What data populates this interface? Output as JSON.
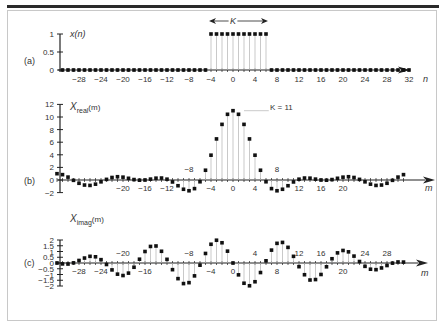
{
  "chart_data": [
    {
      "type": "scatter",
      "panel_label": "(a)",
      "title": "x(n)",
      "xlabel": "n",
      "ylabel": "x(n)",
      "annotation": "K",
      "xlim": [
        -32,
        33
      ],
      "ylim": [
        0,
        1
      ],
      "x_ticks": [
        -28,
        -24,
        -20,
        -16,
        -12,
        -8,
        -4,
        0,
        4,
        8,
        12,
        16,
        20,
        24,
        28,
        32
      ],
      "y_ticks": [
        0,
        0.5,
        1
      ],
      "y_tick_labels": [
        "0",
        "0.5",
        "1"
      ],
      "pulse_start": -4,
      "pulse_end": 6,
      "n_start": -32,
      "n_end": 32
    },
    {
      "type": "scatter",
      "panel_label": "(b)",
      "title": "X_real(m)",
      "xlabel": "m",
      "ylabel": "X_real(m)",
      "annotation": "K = 11",
      "ylim": [
        -2,
        12
      ],
      "y_ticks": [
        -2,
        0,
        2,
        4,
        6,
        8,
        10,
        12
      ],
      "x_tick_labels_below": [
        -20,
        -16,
        -12,
        -4,
        0,
        4,
        12,
        16,
        20
      ],
      "x_tick_labels_above": [
        -8,
        8
      ],
      "m": [
        -32,
        -31,
        -30,
        -29,
        -28,
        -27,
        -26,
        -25,
        -24,
        -23,
        -22,
        -21,
        -20,
        -19,
        -18,
        -17,
        -16,
        -15,
        -14,
        -13,
        -12,
        -11,
        -10,
        -9,
        -8,
        -7,
        -6,
        -5,
        -4,
        -3,
        -2,
        -1,
        0,
        1,
        2,
        3,
        4,
        5,
        6,
        7,
        8,
        9,
        10,
        11,
        12,
        13,
        14,
        15,
        16,
        17,
        18,
        19,
        20,
        21,
        22,
        23,
        24,
        25,
        26,
        27,
        28,
        29,
        30,
        31
      ],
      "values": [
        1.0,
        0.85,
        0.46,
        -0.05,
        -0.52,
        -0.8,
        -0.86,
        -0.66,
        -0.29,
        0.1,
        0.4,
        0.52,
        0.45,
        0.27,
        0.07,
        -0.03,
        0,
        0.14,
        0.29,
        0.31,
        0.13,
        -0.31,
        -0.91,
        -1.47,
        -1.71,
        -1.37,
        -0.28,
        1.55,
        3.94,
        6.52,
        8.83,
        10.43,
        11,
        10.43,
        8.83,
        6.52,
        3.94,
        1.55,
        -0.28,
        -1.37,
        -1.71,
        -1.47,
        -0.91,
        -0.31,
        0.13,
        0.31,
        0.29,
        0.14,
        0,
        -0.03,
        0.07,
        0.27,
        0.45,
        0.52,
        0.4,
        0.1,
        -0.29,
        -0.66,
        -0.86,
        -0.8,
        -0.52,
        -0.05,
        0.46,
        0.85
      ]
    },
    {
      "type": "scatter",
      "panel_label": "(c)",
      "title": "X_imag(m)",
      "xlabel": "m",
      "ylabel": "X_imag(m)",
      "ylim": [
        -2,
        2
      ],
      "y_ticks": [
        -2,
        -1.5,
        -1,
        -0.5,
        0,
        0.5,
        1,
        1.5,
        2
      ],
      "y_tick_labels": [
        "-2",
        "-1.5",
        "-1",
        "-0.5",
        "0",
        "0.5",
        "1",
        "1.5",
        "2"
      ],
      "x_tick_labels_below": [
        -28,
        -24,
        -16,
        -4,
        0,
        8,
        20
      ],
      "x_tick_labels_above": [
        -20,
        -8,
        4,
        12,
        16,
        24,
        28
      ],
      "m": [
        -32,
        -31,
        -30,
        -29,
        -28,
        -27,
        -26,
        -25,
        -24,
        -23,
        -22,
        -21,
        -20,
        -19,
        -18,
        -17,
        -16,
        -15,
        -14,
        -13,
        -12,
        -11,
        -10,
        -9,
        -8,
        -7,
        -6,
        -5,
        -4,
        -3,
        -2,
        -1,
        0,
        1,
        2,
        3,
        4,
        5,
        6,
        7,
        8,
        9,
        10,
        11,
        12,
        13,
        14,
        15,
        16,
        17,
        18,
        19,
        20,
        21,
        22,
        23,
        24,
        25,
        26,
        27,
        28,
        29,
        30,
        31
      ],
      "values": [
        0,
        -0.08,
        -0.09,
        0.01,
        0.22,
        0.43,
        0.58,
        0.54,
        0.29,
        -0.13,
        -0.6,
        -0.97,
        -1.09,
        -0.88,
        -0.37,
        0.33,
        1.0,
        1.44,
        1.48,
        1.02,
        0.32,
        -0.58,
        -1.36,
        -1.79,
        -1.71,
        -1.12,
        -0.19,
        0.83,
        1.63,
        1.98,
        1.76,
        1.03,
        0,
        -1.03,
        -1.76,
        -1.98,
        -1.63,
        -0.83,
        0.19,
        1.12,
        1.71,
        1.79,
        1.36,
        0.58,
        -0.32,
        -1.02,
        -1.48,
        -1.44,
        -1.0,
        -0.33,
        0.37,
        0.88,
        1.09,
        0.97,
        0.6,
        0.13,
        -0.29,
        -0.54,
        -0.58,
        -0.43,
        -0.22,
        -0.01,
        0.09,
        0.08
      ]
    }
  ],
  "labels": {
    "panel_a": "(a)",
    "panel_b": "(b)",
    "panel_c": "(c)",
    "a_ylabel": "x(n)",
    "a_xlabel": "n",
    "a_annotation": "K",
    "b_ylabel_main": "X",
    "b_ylabel_sub": "real",
    "b_ylabel_arg": "(m)",
    "b_annotation": "K = 11",
    "b_xlabel": "m",
    "c_ylabel_main": "X",
    "c_ylabel_sub": "imag",
    "c_ylabel_arg": "(m)",
    "c_xlabel": "m"
  }
}
